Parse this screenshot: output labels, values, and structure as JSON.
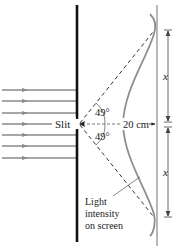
{
  "diagram": {
    "labels": {
      "slit": "Slit",
      "angle_top": "49°",
      "angle_bottom": "49°",
      "distance": "20 cm",
      "x_top": "x",
      "x_bottom": "x",
      "intensity_line1": "Light",
      "intensity_line2": "intensity",
      "intensity_line3": "on screen"
    },
    "incoming_rays": 7,
    "colors": {
      "barrier": "#111111",
      "rays": "#8a8a8a",
      "curve": "#8f8f8f",
      "screen": "#9a9a9a",
      "dashed": "#333333",
      "text": "#222222"
    }
  }
}
